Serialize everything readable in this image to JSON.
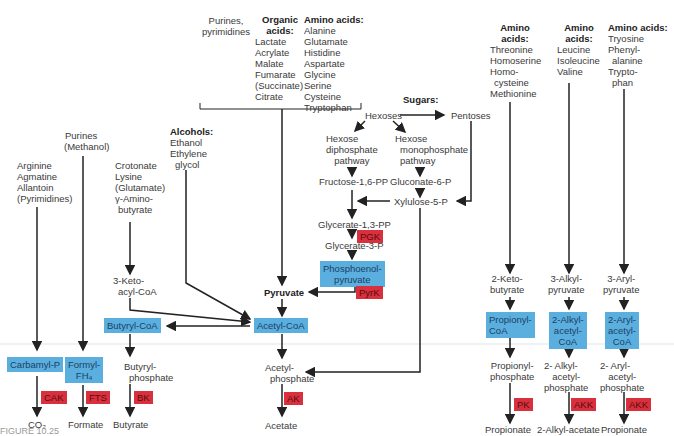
{
  "colors": {
    "enzyme_red": "#d8313d",
    "intermediate_blue": "#5aafdf",
    "line": "#222222"
  },
  "sources": {
    "purines_pyrimidines": [
      "Purines,",
      "pyrimidines"
    ],
    "organic_acids": {
      "title": "Organic acids:",
      "items": [
        "Lactate",
        "Acrylate",
        "Malate",
        "Fumarate",
        "(Succinate)",
        "Citrate"
      ]
    },
    "amino_acids_1": {
      "title": "Amino acids:",
      "items": [
        "Alanine",
        "Glutamate",
        "Histidine",
        "Aspartate",
        "Glycine",
        "Serine",
        "Cysteine",
        "Tryptophan"
      ]
    },
    "sugars": {
      "title": "Sugars:"
    },
    "amino_acids_2": {
      "title": "Amino acids:",
      "items": [
        "Threonine",
        "Homoserine",
        "Homo-",
        "cysteine",
        "Methionine"
      ]
    },
    "amino_acids_3": {
      "title": "Amino acids:",
      "items": [
        "Leucine",
        "Isoleucine",
        "Valine"
      ]
    },
    "amino_acids_4": {
      "title": "Amino acids:",
      "items": [
        "Tryosine",
        "Phenyl-",
        "alanine",
        "Trypto-",
        "phan"
      ]
    },
    "alcohols": {
      "title": "Alcohols:",
      "items": [
        "Ethanol",
        "Ethylene",
        "glycol"
      ]
    },
    "arginine_group": [
      "Arginine",
      "Agmatine",
      "Allantoin",
      "(Pyrimidines)"
    ],
    "purines_methanol": [
      "Purines",
      "(Methanol)"
    ],
    "crotonate_group": [
      "Crotonate",
      "Lysine",
      "(Glutamate)",
      "γ-Amino-",
      "butyrate"
    ]
  },
  "sugar_path": {
    "hexoses": "Hexoses",
    "pentoses": "Pentoses",
    "hdp": [
      "Hexose",
      "diphosphate",
      "pathway"
    ],
    "hmp": [
      "Hexose",
      "monophosphate",
      "pathway"
    ],
    "fructose": "Fructose-1,6-PP",
    "gluconate": "Gluconate-6-P",
    "xylulose": "Xylulose-5-P",
    "glycerate13": "Glycerate-1,3-PP",
    "glycerate3": "Glycerate-3-P",
    "pep": [
      "Phosphoenol-",
      "pyruvate"
    ]
  },
  "intermediates": {
    "keto_acyl": [
      "3-Keto-",
      "acyl-CoA"
    ],
    "pyruvate": "Pyruvate",
    "acetyl_coa": "Acetyl-CoA",
    "butyryl_coa": "Butyryl-CoA",
    "carbamyl_p": "Carbamyl-P",
    "formyl_fh4": [
      "Formyl-",
      "FH₄"
    ],
    "butyryl_phosphate": [
      "Butyryl-",
      "phosphate"
    ],
    "acetyl_phosphate": [
      "Acetyl-",
      "phosphate"
    ],
    "keto_butyrate": [
      "2-Keto-",
      "butyrate"
    ],
    "alkyl_pyruvate": [
      "3-Alkyl-",
      "pyruvate"
    ],
    "aryl_pyruvate": [
      "3-Aryl-",
      "pyruvate"
    ],
    "propionyl_coa": [
      "Propionyl-",
      "CoA"
    ],
    "alkyl_acetyl_coa": [
      "2-Alkyl-",
      "acetyl-",
      "CoA"
    ],
    "aryl_acetyl_coa": [
      "2-Aryl-",
      "acetyl-",
      "CoA"
    ],
    "propionyl_phosphate": [
      "Propionyl-",
      "phosphate"
    ],
    "alkyl_acetyl_phosphate": [
      "2- Alkyl-",
      "acetyl-",
      "phosphate"
    ],
    "aryl_acetyl_phosphate": [
      "2- Aryl-",
      "acetyl-",
      "phosphate"
    ]
  },
  "enzymes": {
    "pgk": "PGK",
    "pyrk": "PyrK",
    "cak": "CAK",
    "fts": "FTS",
    "bk": "BK",
    "ak": "AK",
    "pk": "PK",
    "akk1": "AKK",
    "akk2": "AKK"
  },
  "products": {
    "co2": "CO₂",
    "formate": "Formate",
    "butyrate": "Butyrate",
    "acetate": "Acetate",
    "propionate1": "Propionate",
    "alkyl_acetate": "2-Alkyl-acetate",
    "propionate2": "Propionate"
  },
  "caption": "FIGURE 10.25"
}
